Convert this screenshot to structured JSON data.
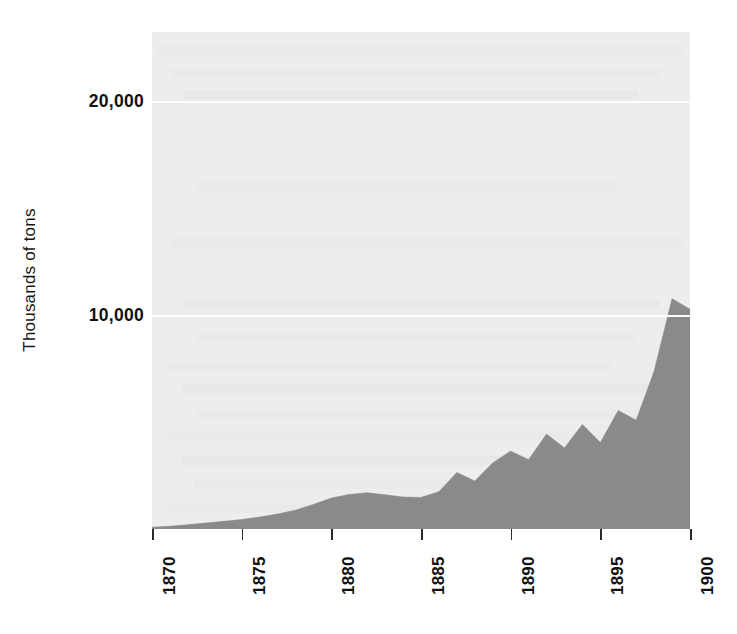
{
  "chart_data": {
    "type": "area",
    "title": "",
    "subtitle": "",
    "xlabel": "",
    "ylabel": "Thousands of tons",
    "xlim": [
      1870,
      1900
    ],
    "ylim": [
      0,
      23300
    ],
    "grid": true,
    "legend": false,
    "legend_position": "none",
    "fill_color": "#8a8a8a",
    "plot_background_color": "#ededed",
    "gridline_color": "#fdfdfd",
    "y_ticks": [
      {
        "value": 10000,
        "label": "10,000"
      },
      {
        "value": 20000,
        "label": "20,000"
      }
    ],
    "x_ticks": [
      {
        "value": 1870,
        "label": "1870"
      },
      {
        "value": 1875,
        "label": "1875"
      },
      {
        "value": 1880,
        "label": "1880"
      },
      {
        "value": 1885,
        "label": "1885"
      },
      {
        "value": 1890,
        "label": "1890"
      },
      {
        "value": 1895,
        "label": "1895"
      },
      {
        "value": 1900,
        "label": "1900"
      }
    ],
    "x": [
      1870,
      1871,
      1872,
      1873,
      1874,
      1875,
      1876,
      1877,
      1878,
      1879,
      1880,
      1881,
      1882,
      1883,
      1884,
      1885,
      1886,
      1887,
      1888,
      1889,
      1890,
      1891,
      1892,
      1893,
      1894,
      1895,
      1896,
      1897,
      1898,
      1899,
      1900
    ],
    "values": [
      80,
      130,
      200,
      280,
      360,
      440,
      560,
      700,
      880,
      1150,
      1450,
      1620,
      1700,
      1600,
      1500,
      1480,
      1750,
      2650,
      2250,
      3100,
      3650,
      3250,
      4450,
      3800,
      4900,
      4050,
      5550,
      5100,
      7400,
      10800,
      10300
    ],
    "annotations": []
  },
  "axis": {
    "y_title": "Thousands of tons"
  }
}
